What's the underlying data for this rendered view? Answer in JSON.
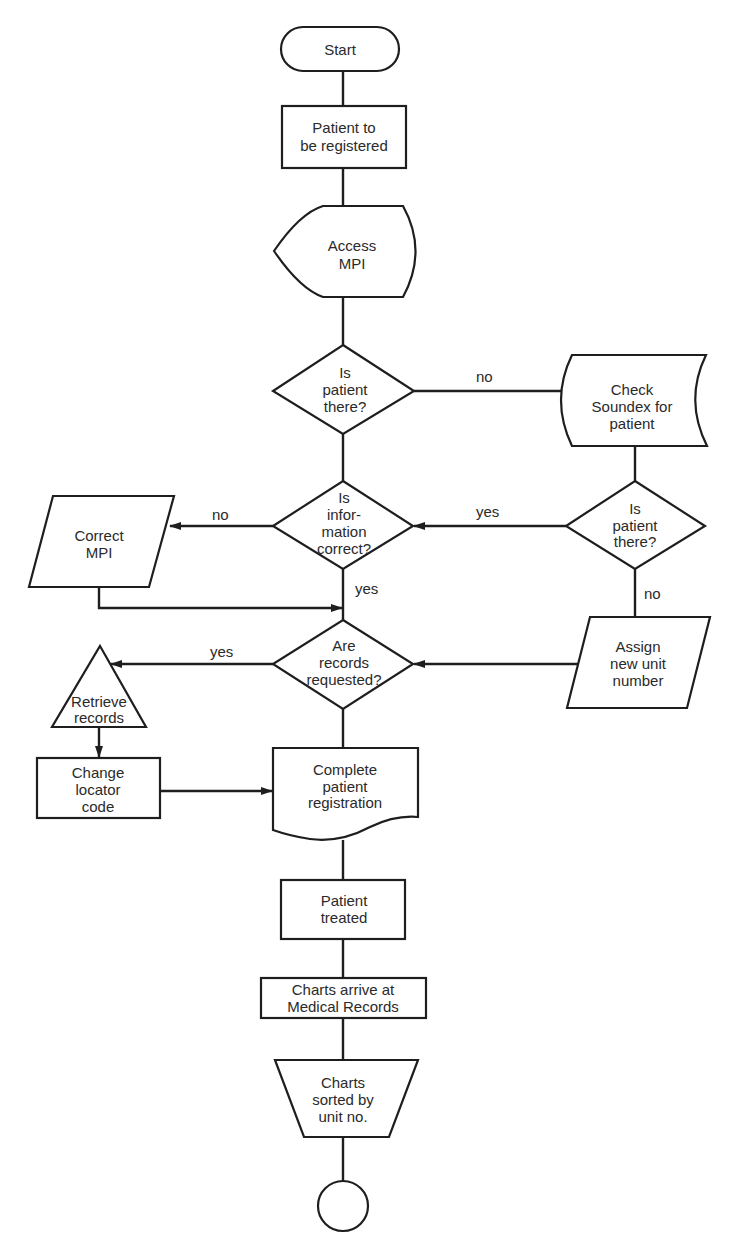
{
  "diagram": {
    "type": "flowchart",
    "colors": {
      "stroke": "#1e1e1e",
      "fill": "#ffffff",
      "text": "#2a2a2a"
    },
    "nodes": {
      "start": {
        "shape": "terminator",
        "lines": [
          "Start"
        ]
      },
      "register": {
        "shape": "process",
        "lines": [
          "Patient to",
          "be registered"
        ]
      },
      "access_mpi": {
        "shape": "display",
        "lines": [
          "Access",
          "MPI"
        ]
      },
      "is_there_1": {
        "shape": "decision",
        "lines": [
          "Is",
          "patient",
          "there?"
        ]
      },
      "soundex": {
        "shape": "stored-data",
        "lines": [
          "Check",
          "Soundex for",
          "patient"
        ]
      },
      "info_correct": {
        "shape": "decision",
        "lines": [
          "Is",
          "infor-",
          "mation",
          "correct?"
        ]
      },
      "is_there_2": {
        "shape": "decision",
        "lines": [
          "Is",
          "patient",
          "there?"
        ]
      },
      "correct_mpi": {
        "shape": "input-output",
        "lines": [
          "Correct",
          "MPI"
        ]
      },
      "records_req": {
        "shape": "decision",
        "lines": [
          "Are",
          "records",
          "requested?"
        ]
      },
      "assign": {
        "shape": "input-output",
        "lines": [
          "Assign",
          "new unit",
          "number"
        ]
      },
      "retrieve": {
        "shape": "extract",
        "lines": [
          "Retrieve",
          "records"
        ]
      },
      "locator": {
        "shape": "process",
        "lines": [
          "Change",
          "locator",
          "code"
        ]
      },
      "complete": {
        "shape": "document",
        "lines": [
          "Complete",
          "patient",
          "registration"
        ]
      },
      "treated": {
        "shape": "process",
        "lines": [
          "Patient",
          "treated"
        ]
      },
      "charts_arrive": {
        "shape": "process",
        "lines": [
          "Charts arrive at",
          "Medical Records"
        ]
      },
      "charts_sorted": {
        "shape": "manual-operation",
        "lines": [
          "Charts",
          "sorted by",
          "unit no."
        ]
      },
      "end": {
        "shape": "connector",
        "lines": []
      }
    },
    "edges": [
      {
        "from": "start",
        "to": "register",
        "label": ""
      },
      {
        "from": "register",
        "to": "access_mpi",
        "label": ""
      },
      {
        "from": "access_mpi",
        "to": "is_there_1",
        "label": ""
      },
      {
        "from": "is_there_1",
        "to": "soundex",
        "label": "no"
      },
      {
        "from": "is_there_1",
        "to": "info_correct",
        "label": ""
      },
      {
        "from": "soundex",
        "to": "is_there_2",
        "label": ""
      },
      {
        "from": "is_there_2",
        "to": "info_correct",
        "label": "yes"
      },
      {
        "from": "is_there_2",
        "to": "assign",
        "label": "no"
      },
      {
        "from": "info_correct",
        "to": "correct_mpi",
        "label": "no"
      },
      {
        "from": "info_correct",
        "to": "records_req",
        "label": "yes"
      },
      {
        "from": "correct_mpi",
        "to": "records_req",
        "label": ""
      },
      {
        "from": "assign",
        "to": "records_req",
        "label": ""
      },
      {
        "from": "records_req",
        "to": "retrieve",
        "label": "yes"
      },
      {
        "from": "records_req",
        "to": "complete",
        "label": ""
      },
      {
        "from": "retrieve",
        "to": "locator",
        "label": ""
      },
      {
        "from": "locator",
        "to": "complete",
        "label": ""
      },
      {
        "from": "complete",
        "to": "treated",
        "label": ""
      },
      {
        "from": "treated",
        "to": "charts_arrive",
        "label": ""
      },
      {
        "from": "charts_arrive",
        "to": "charts_sorted",
        "label": ""
      },
      {
        "from": "charts_sorted",
        "to": "end",
        "label": ""
      }
    ],
    "edge_labels": {
      "is_there_1_no": "no",
      "is_there_2_yes": "yes",
      "info_correct_no": "no",
      "info_correct_yes": "yes",
      "records_req_yes": "yes",
      "is_there_2_no": "no"
    }
  }
}
